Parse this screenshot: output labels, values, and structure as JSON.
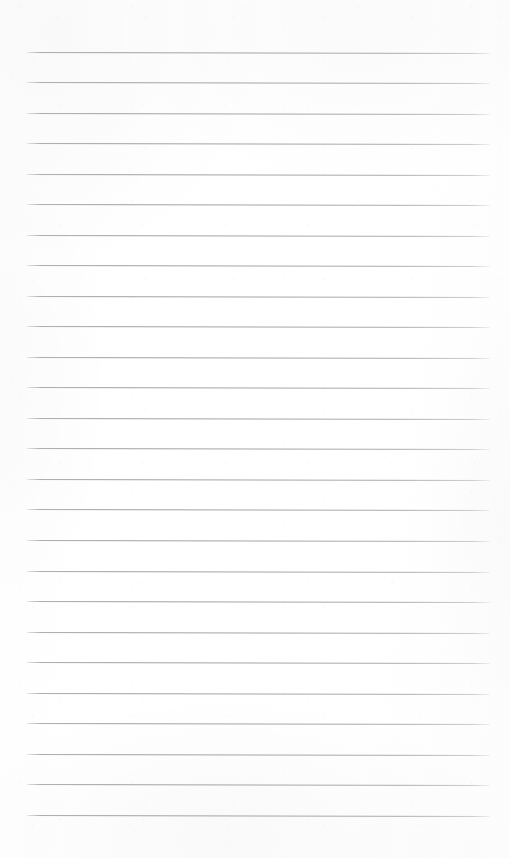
{
  "page": {
    "kind": "scanned-lined-notepad-page",
    "width": 510,
    "height": 858,
    "background_color": "#ffffff",
    "paper_tint_color": "#fdfdfd",
    "has_text_content": false,
    "has_handwriting": false,
    "visible_text": ""
  },
  "ruling": {
    "line_color": "#a4a5ab",
    "line_thickness_px": 1,
    "line_count": 26,
    "left_x": 27,
    "right_x": 490,
    "line_length_px": 463,
    "first_line_y": 52,
    "last_line_y": 815,
    "spacing_px": 30.5,
    "tilt_degrees": 0.12,
    "margins": {
      "top_px": 52,
      "bottom_px": 43,
      "left_px": 27,
      "right_px": 20
    },
    "lines": [
      {
        "index": 1,
        "y": 52
      },
      {
        "index": 2,
        "y": 82
      },
      {
        "index": 3,
        "y": 113
      },
      {
        "index": 4,
        "y": 143
      },
      {
        "index": 5,
        "y": 174
      },
      {
        "index": 6,
        "y": 204
      },
      {
        "index": 7,
        "y": 235
      },
      {
        "index": 8,
        "y": 265
      },
      {
        "index": 9,
        "y": 296
      },
      {
        "index": 10,
        "y": 326
      },
      {
        "index": 11,
        "y": 357
      },
      {
        "index": 12,
        "y": 387
      },
      {
        "index": 13,
        "y": 418
      },
      {
        "index": 14,
        "y": 448
      },
      {
        "index": 15,
        "y": 479
      },
      {
        "index": 16,
        "y": 509
      },
      {
        "index": 17,
        "y": 540
      },
      {
        "index": 18,
        "y": 571
      },
      {
        "index": 19,
        "y": 601
      },
      {
        "index": 20,
        "y": 632
      },
      {
        "index": 21,
        "y": 662
      },
      {
        "index": 22,
        "y": 693
      },
      {
        "index": 23,
        "y": 723
      },
      {
        "index": 24,
        "y": 754
      },
      {
        "index": 25,
        "y": 784
      },
      {
        "index": 26,
        "y": 815
      }
    ]
  }
}
